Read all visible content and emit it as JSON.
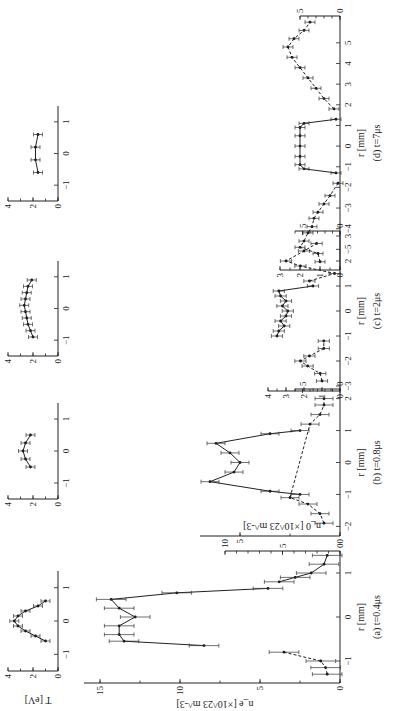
{
  "figure": {
    "orientation": "rotated 90 degrees counterclockwise",
    "shared_labels": {
      "T_ylabel": "T [eV]",
      "ne_ylabel": "n_e [×10^23 m^-3]",
      "n0_ylabel": "n_0 [×10^23 m^-3]",
      "xlabel": "r [mm]"
    },
    "panels": [
      {
        "id": "a",
        "caption": "(a)  t=0.4μs",
        "xlabel": "r [mm]"
      },
      {
        "id": "b",
        "caption": "(b)  t=0.8μs",
        "xlabel": "r [mm]"
      },
      {
        "id": "c",
        "caption": "(c)  t=2μs",
        "xlabel": "r [mm]"
      },
      {
        "id": "d",
        "caption": "(d)  t=7μs",
        "xlabel": "r [mm]"
      }
    ]
  },
  "chart_data": [
    {
      "type": "line",
      "panel": "a",
      "title": "(a) t=0.4μs — electron temperature",
      "xlabel": "r [mm]",
      "ylabel": "T [eV]",
      "xlim": [
        -1.5,
        1.5
      ],
      "ylim": [
        0,
        4
      ],
      "xticks": [
        -1,
        0,
        1
      ],
      "yticks": [
        0,
        2,
        4
      ],
      "x": [
        -0.6,
        -0.45,
        -0.3,
        -0.15,
        0.0,
        0.15,
        0.3,
        0.45,
        0.6
      ],
      "values": [
        1.0,
        1.8,
        2.6,
        3.2,
        3.5,
        3.2,
        2.6,
        1.6,
        1.0
      ]
    },
    {
      "type": "line",
      "panel": "a",
      "title": "(a) t=0.4μs — electron density n_e and neutral density n_0",
      "xlabel": "r [mm]",
      "ylabel": "n_e [×10^23 m^-3]",
      "y2label": "n_0 [×10^23 m^-3]",
      "xlim": [
        -1.5,
        1.5
      ],
      "ylim": [
        0,
        16
      ],
      "y2lim": [
        0,
        10
      ],
      "xticks": [
        -1,
        0,
        1
      ],
      "yticks": [
        0,
        5,
        10,
        15
      ],
      "y2ticks": [
        0,
        5,
        10
      ],
      "series": [
        {
          "name": "n_e",
          "x": [
            -0.65,
            -0.55,
            -0.4,
            -0.2,
            0.0,
            0.2,
            0.4,
            0.55,
            0.65
          ],
          "values": [
            8.5,
            13.5,
            13.8,
            13.8,
            12.8,
            13.8,
            14.3,
            10.2,
            4.5
          ]
        },
        {
          "name": "n_0 (dashed)",
          "x": [
            -1.3,
            -1.15,
            -1.0,
            -0.8
          ],
          "values": [
            0.8,
            0.9,
            1.2,
            3.5
          ]
        },
        {
          "name": "n_0 (solid)",
          "x": [
            0.8,
            0.9,
            1.0,
            1.2,
            1.4
          ],
          "values": [
            3.8,
            2.8,
            1.8,
            1.0,
            0.8
          ]
        }
      ]
    },
    {
      "type": "line",
      "panel": "b",
      "title": "(b) t=0.8μs — electron temperature",
      "xlabel": "r [mm]",
      "ylabel": "T [eV]",
      "xlim": [
        -1.5,
        1.5
      ],
      "ylim": [
        0,
        4
      ],
      "xticks": [
        -1,
        0,
        1
      ],
      "yticks": [
        0,
        2,
        4
      ],
      "x": [
        -0.5,
        -0.25,
        0.0,
        0.25,
        0.5
      ],
      "values": [
        2.2,
        2.6,
        2.8,
        2.6,
        2.2
      ]
    },
    {
      "type": "line",
      "panel": "b",
      "title": "(b) t=0.8μs — electron density n_e and neutral density n_0",
      "xlabel": "r [mm]",
      "ylabel": "n_e [×10^23 m^-3]",
      "y2label": "n_0",
      "xlim": [
        -2.3,
        2.3
      ],
      "ylim": [
        0,
        7
      ],
      "y2lim": [
        0,
        6
      ],
      "xticks": [
        -2,
        -1,
        0,
        1,
        2
      ],
      "yticks": [
        0,
        5
      ],
      "y2ticks": [
        0,
        5
      ],
      "series": [
        {
          "name": "n_e",
          "x": [
            -1.0,
            -0.9,
            -0.6,
            -0.3,
            0.0,
            0.3,
            0.6,
            0.9,
            1.0
          ],
          "values": [
            2.0,
            3.5,
            6.5,
            5.3,
            5.0,
            5.5,
            6.2,
            3.5,
            2.0
          ]
        },
        {
          "name": "n_0",
          "x": [
            -1.9,
            -1.6,
            -1.3,
            -1.1,
            1.2,
            1.5,
            1.8,
            2.0
          ],
          "values": [
            0.8,
            1.0,
            1.6,
            2.5,
            1.5,
            1.0,
            0.8,
            0.8
          ]
        }
      ]
    },
    {
      "type": "line",
      "panel": "c",
      "title": "(c) t=2μs — electron temperature",
      "xlabel": "r [mm]",
      "ylabel": "T [eV]",
      "xlim": [
        -1.5,
        1.5
      ],
      "ylim": [
        0,
        4
      ],
      "xticks": [
        -1,
        0,
        1
      ],
      "yticks": [
        0,
        2,
        4
      ],
      "x": [
        -0.9,
        -0.7,
        -0.5,
        -0.3,
        -0.1,
        0.1,
        0.3,
        0.5,
        0.7,
        0.9
      ],
      "values": [
        2.0,
        2.2,
        2.4,
        2.5,
        2.6,
        2.7,
        2.6,
        2.5,
        2.4,
        2.1
      ]
    },
    {
      "type": "line",
      "panel": "c",
      "title": "(c) t=2μs — electron density n_e and neutral density n_0",
      "xlabel": "r [mm]",
      "ylabel": "n_e [×10^23 m^-3]",
      "y2label": "n_0",
      "xlim": [
        -3.2,
        3.2
      ],
      "ylim": [
        0,
        4
      ],
      "y2lim": [
        0,
        6
      ],
      "xticks": [
        -3,
        -2,
        -1,
        0,
        1,
        2,
        3
      ],
      "yticks": [
        0,
        1,
        2,
        3,
        4
      ],
      "y2ticks": [
        0,
        5
      ],
      "series": [
        {
          "name": "n_e",
          "x": [
            -1.0,
            -0.8,
            -0.6,
            -0.4,
            -0.2,
            0.0,
            0.2,
            0.4,
            0.6,
            0.8,
            1.0
          ],
          "values": [
            3.5,
            3.4,
            3.1,
            3.3,
            3.0,
            2.9,
            3.2,
            3.0,
            3.3,
            3.4,
            1.5
          ]
        },
        {
          "name": "n_0 (left)",
          "x": [
            -2.8,
            -2.5,
            -2.2,
            -2.0,
            -1.8,
            -1.5,
            -1.2
          ],
          "values": [
            1.0,
            1.1,
            1.8,
            2.2,
            1.7,
            0.9,
            0.9
          ]
        },
        {
          "name": "n_0 (right)",
          "x": [
            1.2,
            1.5,
            1.8,
            2.0,
            2.4,
            2.7
          ],
          "values": [
            1.7,
            0.3,
            2.2,
            3.0,
            2.0,
            1.3
          ]
        }
      ]
    },
    {
      "type": "line",
      "panel": "d",
      "title": "(d) t=7μs — electron temperature",
      "xlabel": "r [mm]",
      "ylabel": "T [eV]",
      "xlim": [
        -1.5,
        1.5
      ],
      "ylim": [
        0,
        4
      ],
      "xticks": [
        -1,
        0,
        1
      ],
      "yticks": [
        0,
        2,
        4
      ],
      "x": [
        -0.6,
        -0.2,
        0.2,
        0.6
      ],
      "values": [
        1.6,
        1.8,
        1.8,
        1.6
      ]
    },
    {
      "type": "line",
      "panel": "d",
      "title": "(d) t=7μs — electron density n_e and neutral density n_0",
      "xlabel": "r [mm]",
      "ylabel": "n_e [×10^23 m^-3]",
      "y2label": "n_0",
      "xlim": [
        -6,
        6.3
      ],
      "ylim": [
        0,
        3
      ],
      "y2lim": [
        0,
        5
      ],
      "xticks": [
        -5,
        -4,
        -3,
        -2,
        -1,
        0,
        1,
        2,
        3,
        4,
        5
      ],
      "yticks": [
        0,
        1,
        2,
        3
      ],
      "y2ticks": [
        0,
        5
      ],
      "series": [
        {
          "name": "n_e",
          "x": [
            -1.3,
            -1.1,
            -0.9,
            -0.5,
            0.0,
            0.5,
            0.9,
            1.1,
            1.3
          ],
          "values": [
            0.2,
            1.8,
            2.0,
            2.0,
            2.0,
            2.0,
            2.0,
            1.8,
            0.2
          ]
        },
        {
          "name": "n_0 (left)",
          "x": [
            -5.6,
            -5.2,
            -4.9,
            -4.6,
            -4.2,
            -3.9,
            -3.5,
            -3.2,
            -2.8,
            -2.4,
            -1.8
          ],
          "values": [
            1.0,
            1.1,
            2.0,
            1.8,
            1.6,
            1.4,
            1.3,
            1.1,
            0.8,
            0.5,
            0.1
          ]
        },
        {
          "name": "n_0 (right)",
          "x": [
            1.8,
            2.3,
            2.8,
            3.3,
            3.8,
            4.3,
            4.8,
            5.2,
            5.6,
            6.0
          ],
          "values": [
            0.3,
            0.8,
            1.2,
            1.6,
            2.0,
            2.4,
            2.6,
            2.3,
            1.8,
            1.5
          ]
        }
      ]
    }
  ]
}
